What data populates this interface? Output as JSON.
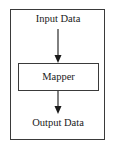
{
  "diagram": {
    "type": "flow",
    "nodes": [
      {
        "id": "input",
        "label": "Input Data",
        "shape": "text"
      },
      {
        "id": "mapper",
        "label": "Mapper",
        "shape": "rectangle"
      },
      {
        "id": "output",
        "label": "Output Data",
        "shape": "text"
      }
    ],
    "edges": [
      {
        "from": "input",
        "to": "mapper",
        "style": "arrow"
      },
      {
        "from": "mapper",
        "to": "output",
        "style": "arrow"
      }
    ],
    "colors": {
      "line": "#3a3a3a",
      "text": "#1a1a1a",
      "background": "#ffffff"
    }
  },
  "labels": {
    "input": "Input Data",
    "mapper": "Mapper",
    "output": "Output Data"
  }
}
